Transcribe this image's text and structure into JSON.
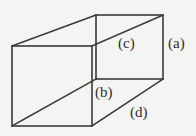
{
  "diagram": {
    "type": "rectangular-prism-wireframe",
    "stroke_color": "#3a3a3a",
    "background": "#f4f4f2",
    "labels": {
      "a": "(a)",
      "b": "(b)",
      "c": "(c)",
      "d": "(d)"
    },
    "vertices": {
      "front_top_left": [
        12,
        46
      ],
      "front_top_right": [
        92,
        46
      ],
      "front_bottom_left": [
        12,
        126
      ],
      "front_bottom_right": [
        92,
        126
      ],
      "back_top_left": [
        96,
        15
      ],
      "back_top_right": [
        163,
        15
      ],
      "back_bottom_left": [
        96,
        79
      ],
      "back_bottom_right": [
        163,
        79
      ]
    }
  }
}
